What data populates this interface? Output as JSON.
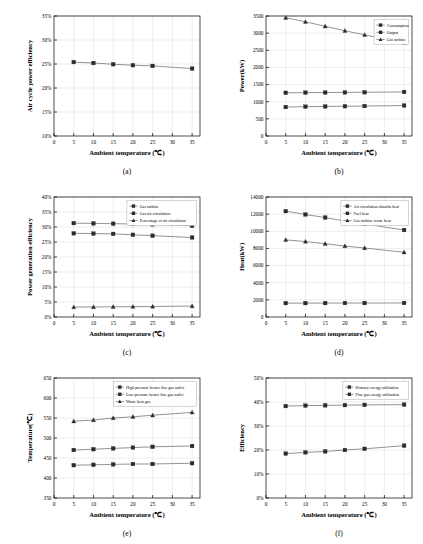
{
  "figure": {
    "panels": [
      "a",
      "b",
      "c",
      "d",
      "e",
      "f"
    ],
    "x_values": [
      5,
      10,
      15,
      20,
      25,
      30,
      35
    ],
    "data_x": [
      5,
      10,
      15,
      20,
      25,
      35
    ]
  },
  "captions": {
    "a": "(a)",
    "b": "(b)",
    "c": "(c)",
    "d": "(d)",
    "e": "(e)",
    "f": "(f)"
  },
  "chart_data": [
    {
      "panel": "a",
      "type": "line",
      "title": "",
      "xlabel": "Ambient temperature (℃)",
      "ylabel": "Air cycle power efficiency",
      "xlim": [
        0,
        37
      ],
      "ylim": [
        10,
        35
      ],
      "xticks": [
        0,
        5,
        10,
        15,
        20,
        25,
        30,
        35
      ],
      "xticklabels": [
        "0",
        "5",
        "10",
        "15",
        "20",
        "25",
        "30",
        "35"
      ],
      "yticks": [
        10,
        15,
        20,
        25,
        30,
        35
      ],
      "yticklabels": [
        "10%",
        "15%",
        "20%",
        "25%",
        "30%",
        "35%"
      ],
      "grid": true,
      "legend": null,
      "x": [
        5,
        10,
        15,
        20,
        25,
        35
      ],
      "series": [
        {
          "name": "Air cycle power efficiency",
          "marker": "square",
          "values": [
            25.4,
            25.2,
            24.95,
            24.75,
            24.6,
            24.05
          ]
        }
      ]
    },
    {
      "panel": "b",
      "type": "line",
      "title": "",
      "xlabel": "Ambient temperature (℃)",
      "ylabel": "Power(kW)",
      "xlim": [
        0,
        37
      ],
      "ylim": [
        0,
        3500
      ],
      "xticks": [
        0,
        5,
        10,
        15,
        20,
        25,
        30,
        35
      ],
      "xticklabels": [
        "0",
        "5",
        "10",
        "15",
        "20",
        "25",
        "30",
        "35"
      ],
      "yticks": [
        0,
        500,
        1000,
        1500,
        2000,
        2500,
        3000,
        3500
      ],
      "yticklabels": [
        "0",
        "500",
        "1000",
        "1500",
        "2000",
        "2500",
        "3000",
        "3500"
      ],
      "grid": true,
      "legend": {
        "position": "top-right",
        "entries": [
          "Consumption",
          "Output",
          "Gas turbine"
        ]
      },
      "x": [
        5,
        10,
        15,
        20,
        25,
        35
      ],
      "series": [
        {
          "name": "Consumption",
          "marker": "square",
          "values": [
            1260,
            1265,
            1268,
            1272,
            1276,
            1285
          ]
        },
        {
          "name": "Output",
          "marker": "square",
          "values": [
            845,
            855,
            862,
            868,
            874,
            888
          ]
        },
        {
          "name": "Gas turbine",
          "marker": "triangle",
          "values": [
            3450,
            3330,
            3200,
            3070,
            2950,
            2720
          ]
        }
      ]
    },
    {
      "panel": "c",
      "type": "line",
      "title": "",
      "xlabel": "Ambient temperature (℃)",
      "ylabel": "Power generation efficiency",
      "xlim": [
        0,
        37
      ],
      "ylim": [
        0,
        40
      ],
      "xticks": [
        0,
        5,
        10,
        15,
        20,
        25,
        30,
        35
      ],
      "xticklabels": [
        "0",
        "5",
        "10",
        "15",
        "20",
        "25",
        "30",
        "35"
      ],
      "yticks": [
        0,
        5,
        10,
        15,
        20,
        25,
        30,
        35,
        40
      ],
      "yticklabels": [
        "0%",
        "5%",
        "10%",
        "15%",
        "20%",
        "25%",
        "30%",
        "35%",
        "40%"
      ],
      "grid": true,
      "legend": {
        "position": "top-right",
        "entries": [
          "Gas turbine",
          "Gas-air circulation",
          "Percentage of air circulation"
        ]
      },
      "x": [
        5,
        10,
        15,
        20,
        25,
        35
      ],
      "series": [
        {
          "name": "Gas turbine",
          "marker": "square",
          "values": [
            31.3,
            31.2,
            31.1,
            31.0,
            30.9,
            30.4
          ]
        },
        {
          "name": "Gas-air circulation",
          "marker": "square",
          "values": [
            27.9,
            27.8,
            27.7,
            27.4,
            27.1,
            26.5
          ]
        },
        {
          "name": "Percentage of air circulation",
          "marker": "triangle",
          "values": [
            3.3,
            3.35,
            3.4,
            3.45,
            3.5,
            3.65
          ]
        }
      ]
    },
    {
      "panel": "d",
      "type": "line",
      "title": "",
      "xlabel": "Ambient temperature (℃)",
      "ylabel": "Heat(kW)",
      "xlim": [
        0,
        37
      ],
      "ylim": [
        0,
        14000
      ],
      "xticks": [
        0,
        5,
        10,
        15,
        20,
        25,
        30,
        35
      ],
      "xticklabels": [
        "0",
        "5",
        "10",
        "15",
        "20",
        "25",
        "30",
        "35"
      ],
      "yticks": [
        0,
        2000,
        4000,
        6000,
        8000,
        10000,
        12000,
        14000
      ],
      "yticklabels": [
        "0",
        "2000",
        "4000",
        "6000",
        "8000",
        "10000",
        "12000",
        "14000"
      ],
      "grid": true,
      "legend": {
        "position": "top-right",
        "entries": [
          "Air circulation absorbs heat",
          "Fuel heat",
          "Gas turbine waste heat"
        ]
      },
      "x": [
        5,
        10,
        15,
        20,
        25,
        35
      ],
      "series": [
        {
          "name": "Air circulation absorbs heat",
          "marker": "square",
          "values": [
            1620,
            1620,
            1625,
            1630,
            1630,
            1635
          ]
        },
        {
          "name": "Fuel heat",
          "marker": "square",
          "values": [
            12350,
            11960,
            11600,
            11200,
            10850,
            10150
          ]
        },
        {
          "name": "Gas turbine waste heat",
          "marker": "triangle",
          "values": [
            9000,
            8800,
            8550,
            8280,
            8050,
            7550
          ]
        }
      ]
    },
    {
      "panel": "e",
      "type": "line",
      "title": "",
      "xlabel": "Ambient temperature (℃)",
      "ylabel": "Temperature(℃)",
      "xlim": [
        0,
        37
      ],
      "ylim": [
        350,
        650
      ],
      "xticks": [
        0,
        5,
        10,
        15,
        20,
        25,
        30,
        35
      ],
      "xticklabels": [
        "0",
        "5",
        "10",
        "15",
        "20",
        "25",
        "30",
        "35"
      ],
      "yticks": [
        350,
        400,
        450,
        500,
        550,
        600,
        650
      ],
      "yticklabels": [
        "350",
        "400",
        "450",
        "500",
        "550",
        "600",
        "650"
      ],
      "grid": true,
      "legend": {
        "position": "top-right",
        "entries": [
          "High pressure heater flue gas outlet",
          "Low pressure heater flue gas outlet",
          "Waste heat gas"
        ]
      },
      "x": [
        5,
        10,
        15,
        20,
        25,
        35
      ],
      "series": [
        {
          "name": "High pressure heater flue gas outlet",
          "marker": "square",
          "values": [
            470,
            472,
            474,
            476,
            478,
            480
          ]
        },
        {
          "name": "Low pressure heater flue gas outlet",
          "marker": "square",
          "values": [
            432,
            433,
            434,
            435,
            435,
            437
          ]
        },
        {
          "name": "Waste heat gas",
          "marker": "triangle",
          "values": [
            542,
            545,
            550,
            553,
            557,
            564
          ]
        }
      ]
    },
    {
      "panel": "f",
      "type": "line",
      "title": "",
      "xlabel": "Ambient temperature (℃)",
      "ylabel": "Efficiency",
      "xlim": [
        0,
        37
      ],
      "ylim": [
        0,
        50
      ],
      "xticks": [
        0,
        5,
        10,
        15,
        20,
        25,
        30,
        35
      ],
      "xticklabels": [
        "0",
        "5",
        "10",
        "15",
        "20",
        "25",
        "30",
        "35"
      ],
      "yticks": [
        0,
        10,
        20,
        30,
        40,
        50
      ],
      "yticklabels": [
        "0%",
        "10%",
        "20%",
        "30%",
        "40%",
        "50%"
      ],
      "grid": true,
      "legend": {
        "position": "top-right",
        "entries": [
          "Primary energy utilization",
          "Flue gas energy utilization"
        ]
      },
      "x": [
        5,
        10,
        15,
        20,
        25,
        35
      ],
      "series": [
        {
          "name": "Primary energy utilization",
          "marker": "square",
          "values": [
            38.3,
            38.5,
            38.6,
            38.7,
            38.8,
            38.9
          ]
        },
        {
          "name": "Flue gas energy utilization",
          "marker": "square",
          "values": [
            18.5,
            19.0,
            19.4,
            20.0,
            20.5,
            21.8
          ]
        }
      ]
    }
  ]
}
